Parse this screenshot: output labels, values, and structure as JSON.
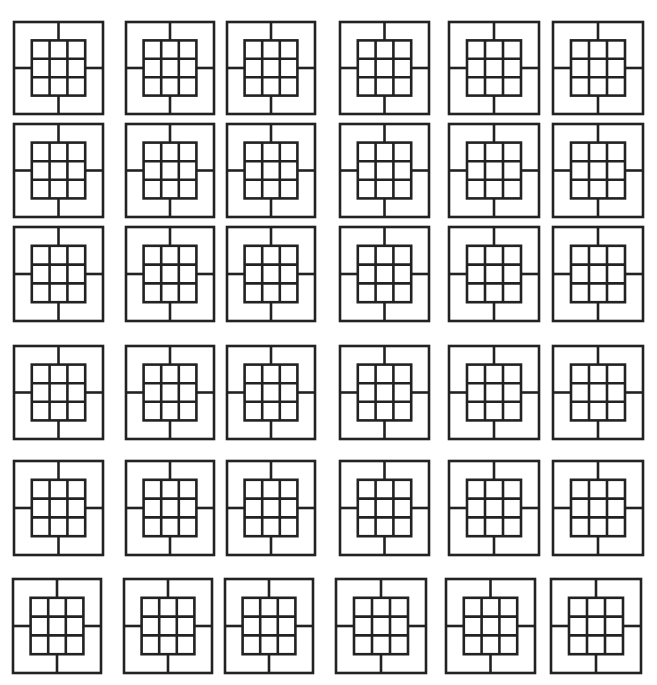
{
  "figure": {
    "stroke_color": "#222222",
    "background_color": "#ffffff",
    "rows": 6,
    "columns": 6,
    "motif": {
      "outer_shape": "square",
      "inner_grid": "3x3",
      "connectors": [
        "top",
        "right",
        "bottom",
        "left"
      ],
      "inner_ratio": 0.6
    },
    "column_x": [
      {
        "left": 14,
        "right": 103
      },
      {
        "left": 126,
        "right": 214
      },
      {
        "left": 227,
        "right": 315
      },
      {
        "left": 340,
        "right": 429
      },
      {
        "left": 449,
        "right": 539
      },
      {
        "left": 553,
        "right": 643
      }
    ],
    "row_y": [
      {
        "top": 22,
        "bottom": 114
      },
      {
        "top": 124,
        "bottom": 217
      },
      {
        "top": 227,
        "bottom": 321
      },
      {
        "top": 346,
        "bottom": 439
      },
      {
        "top": 461,
        "bottom": 555
      },
      {
        "top": 579,
        "bottom": 673
      }
    ],
    "bottom_row_x_override": [
      {
        "left": 13,
        "right": 101
      },
      {
        "left": 124,
        "right": 212
      },
      {
        "left": 225,
        "right": 313
      },
      {
        "left": 336,
        "right": 426
      },
      {
        "left": 446,
        "right": 535
      },
      {
        "left": 551,
        "right": 641
      }
    ]
  }
}
